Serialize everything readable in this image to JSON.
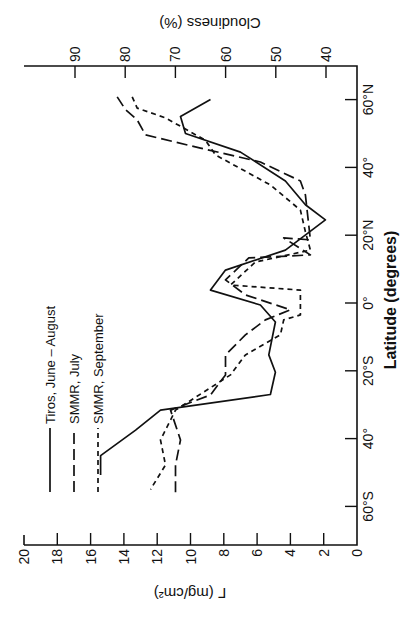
{
  "chart_data": {
    "type": "line",
    "orientation_note": "figure displayed rotated; latitude runs along vertical page axis",
    "title": "",
    "xlabel": "Latitude (degrees)",
    "ylabel": "Γ (mg/cm²)",
    "y2label": "Cloudiness (%)",
    "xlim": [
      -71,
      70
    ],
    "ylim": [
      0,
      20
    ],
    "y2lim": [
      40,
      90
    ],
    "grid": false,
    "legend_position": "upper-left (rotated)",
    "x_ticks": [
      {
        "value": 60,
        "label": "60°N"
      },
      {
        "value": 40,
        "label": "40°"
      },
      {
        "value": 20,
        "label": "20°N"
      },
      {
        "value": 0,
        "label": "0°"
      },
      {
        "value": -20,
        "label": "20°S"
      },
      {
        "value": -40,
        "label": "40°"
      },
      {
        "value": -60,
        "label": "60°S"
      }
    ],
    "y_ticks": [
      {
        "value": 0,
        "label": "0"
      },
      {
        "value": 2,
        "label": "2"
      },
      {
        "value": 4,
        "label": "4"
      },
      {
        "value": 6,
        "label": "6"
      },
      {
        "value": 8,
        "label": "8"
      },
      {
        "value": 10,
        "label": "10"
      },
      {
        "value": 12,
        "label": "12"
      },
      {
        "value": 14,
        "label": "14"
      },
      {
        "value": 16,
        "label": "16"
      },
      {
        "value": 18,
        "label": "18"
      },
      {
        "value": 20,
        "label": "20"
      }
    ],
    "y2_ticks": [
      {
        "value": 40,
        "label": "40"
      },
      {
        "value": 50,
        "label": "50"
      },
      {
        "value": 60,
        "label": "60"
      },
      {
        "value": 70,
        "label": "70"
      },
      {
        "value": 80,
        "label": "80"
      },
      {
        "value": 90,
        "label": "90"
      }
    ],
    "series": [
      {
        "name": "Tiros, June – August",
        "style": "solid",
        "lat": [
          60,
          55,
          50,
          44.5,
          36,
          29,
          24.5,
          15.6,
          9.7,
          3.8,
          -0.6,
          -5.6,
          -15.3,
          -20.4,
          -27,
          -31.6,
          -37.5,
          -45,
          -50.7
        ],
        "values": [
          8.8,
          10.6,
          10.3,
          7.0,
          4.3,
          3.1,
          1.9,
          4.3,
          7.9,
          8.8,
          5.8,
          4.9,
          5.3,
          4.9,
          5.2,
          11.8,
          13.3,
          15.4,
          15.4
        ]
      },
      {
        "name": "SMMR, July",
        "style": "long-dash",
        "lat": [
          60.8,
          57,
          54,
          49.6,
          45.7,
          41.6,
          36,
          31.9,
          18.6,
          19.2,
          14.2,
          13.3,
          6.8,
          2.4,
          -2,
          -5,
          -9.4,
          -15.3,
          -21.2,
          -27.1,
          -31.6,
          -40.4,
          -47.8,
          -56.6
        ],
        "values": [
          14.4,
          13.9,
          13.2,
          12.7,
          9.4,
          5.8,
          3.4,
          3.1,
          2.8,
          4.4,
          2.8,
          6.5,
          7.9,
          6.7,
          4.0,
          5.5,
          6.7,
          7.9,
          7.9,
          8.8,
          11.2,
          10.6,
          10.9,
          10.9
        ]
      },
      {
        "name": "SMMR, September",
        "style": "short-dash",
        "lat": [
          60.8,
          57.5,
          54.6,
          48,
          43.7,
          34.8,
          27.4,
          21,
          15.6,
          12.1,
          5.3,
          3.8,
          -3.5,
          -5,
          -9.4,
          -15.3,
          -21.2,
          -31.6,
          -40.4,
          -47.8,
          -55
        ],
        "values": [
          13.5,
          13.2,
          11.5,
          9.1,
          8.5,
          5.2,
          3.4,
          3.1,
          2.8,
          6.1,
          7.6,
          3.4,
          3.4,
          4.4,
          4.6,
          6.7,
          7.6,
          10.9,
          11.8,
          11.5,
          12.4
        ]
      }
    ]
  },
  "labels": {
    "ylabel": "Γ (mg/cm²)",
    "y2label": "Cloudiness (%)",
    "xlabel": "Latitude (degrees)",
    "legend": [
      "Tiros, June – August",
      "SMMR, July",
      "SMMR, September"
    ]
  },
  "colors": {
    "ink": "#111111",
    "background": "#ffffff"
  }
}
